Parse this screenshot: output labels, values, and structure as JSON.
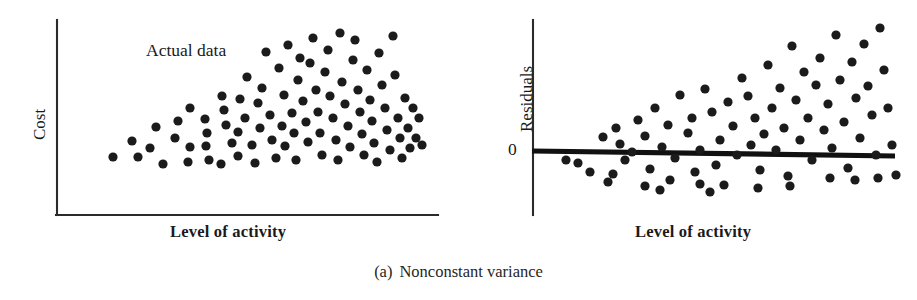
{
  "caption": {
    "index": "(a)",
    "text": "Nonconstant variance"
  },
  "panels": {
    "left": {
      "name": "actual-data-scatter",
      "ylabel": "Cost",
      "xlabel": "Level of activity",
      "annotation": "Actual data"
    },
    "right": {
      "name": "residual-plot",
      "ylabel": "Residuals",
      "xlabel": "Level of activity",
      "zero_tick": "0"
    }
  },
  "colors": {
    "ink": "#1a1a1a",
    "dot": "#1b1b1b",
    "axis": "#2b2b2b",
    "zero_line": "#111111",
    "background": "#ffffff"
  },
  "chart_data": [
    {
      "type": "scatter",
      "id": "actual-data-scatter",
      "title": "",
      "xlabel": "Level of activity",
      "ylabel": "Cost",
      "annotations": [
        "Actual data"
      ],
      "grid": false,
      "legend": null,
      "axes": {
        "origin_px": [
          57,
          215
        ],
        "x_axis_end_px": [
          438,
          215
        ],
        "y_axis_top_px": [
          57,
          20
        ],
        "xlim": [
          0,
          100
        ],
        "ylim": [
          0,
          100
        ],
        "ticks": []
      },
      "dot_radius_px": 4.6,
      "points_px": [
        [
          113,
          157
        ],
        [
          132,
          141
        ],
        [
          138,
          157
        ],
        [
          150,
          148
        ],
        [
          163,
          164
        ],
        [
          156,
          127
        ],
        [
          175,
          138
        ],
        [
          178,
          121
        ],
        [
          190,
          147
        ],
        [
          188,
          162
        ],
        [
          190,
          108
        ],
        [
          205,
          119
        ],
        [
          207,
          133
        ],
        [
          206,
          146
        ],
        [
          209,
          160
        ],
        [
          221,
          164
        ],
        [
          222,
          96
        ],
        [
          224,
          110
        ],
        [
          226,
          125
        ],
        [
          232,
          143
        ],
        [
          238,
          156
        ],
        [
          238,
          132
        ],
        [
          240,
          99
        ],
        [
          245,
          118
        ],
        [
          247,
          77
        ],
        [
          252,
          145
        ],
        [
          255,
          163
        ],
        [
          258,
          103
        ],
        [
          260,
          128
        ],
        [
          262,
          88
        ],
        [
          266,
          52
        ],
        [
          270,
          115
        ],
        [
          272,
          140
        ],
        [
          276,
          158
        ],
        [
          279,
          68
        ],
        [
          282,
          126
        ],
        [
          284,
          95
        ],
        [
          285,
          146
        ],
        [
          288,
          45
        ],
        [
          292,
          113
        ],
        [
          294,
          133
        ],
        [
          296,
          160
        ],
        [
          298,
          80
        ],
        [
          300,
          58
        ],
        [
          303,
          101
        ],
        [
          306,
          122
        ],
        [
          308,
          142
        ],
        [
          310,
          63
        ],
        [
          313,
          38
        ],
        [
          316,
          90
        ],
        [
          318,
          112
        ],
        [
          320,
          133
        ],
        [
          322,
          155
        ],
        [
          325,
          72
        ],
        [
          328,
          50
        ],
        [
          330,
          96
        ],
        [
          333,
          118
        ],
        [
          336,
          140
        ],
        [
          338,
          160
        ],
        [
          340,
          33
        ],
        [
          342,
          82
        ],
        [
          345,
          104
        ],
        [
          348,
          126
        ],
        [
          350,
          147
        ],
        [
          353,
          60
        ],
        [
          355,
          40
        ],
        [
          358,
          90
        ],
        [
          360,
          112
        ],
        [
          362,
          134
        ],
        [
          364,
          155
        ],
        [
          367,
          70
        ],
        [
          370,
          100
        ],
        [
          372,
          121
        ],
        [
          374,
          143
        ],
        [
          377,
          162
        ],
        [
          379,
          53
        ],
        [
          382,
          85
        ],
        [
          385,
          108
        ],
        [
          387,
          130
        ],
        [
          390,
          150
        ],
        [
          393,
          36
        ],
        [
          395,
          75
        ],
        [
          398,
          118
        ],
        [
          400,
          138
        ],
        [
          402,
          158
        ],
        [
          405,
          98
        ],
        [
          408,
          128
        ],
        [
          410,
          148
        ],
        [
          413,
          108
        ],
        [
          416,
          138
        ],
        [
          419,
          118
        ],
        [
          422,
          145
        ]
      ]
    },
    {
      "type": "scatter",
      "id": "residual-plot",
      "title": "",
      "xlabel": "Level of activity",
      "ylabel": "Residuals",
      "annotations": [],
      "grid": false,
      "legend": null,
      "axes": {
        "origin_px": [
          533,
          152
        ],
        "y_axis_top_px": [
          533,
          20
        ],
        "y_axis_bottom_px": [
          533,
          215
        ],
        "zero_line_px": [
          [
            533,
            151
          ],
          [
            895,
            156
          ]
        ],
        "xlim": [
          0,
          100
        ],
        "ylim": [
          -25,
          75
        ],
        "ticks": [
          {
            "axis": "y",
            "value": 0,
            "label": "0"
          }
        ]
      },
      "dot_radius_px": 4.6,
      "reference_line": {
        "label": "0",
        "slope": "near-zero",
        "description": "thick horizontal residual-zero line"
      },
      "dot_radius_note": "residuals fan outward as level of activity increases",
      "points_px": [
        [
          603,
          137
        ],
        [
          578,
          163
        ],
        [
          616,
          128
        ],
        [
          620,
          144
        ],
        [
          625,
          160
        ],
        [
          613,
          174
        ],
        [
          632,
          152
        ],
        [
          638,
          120
        ],
        [
          645,
          136
        ],
        [
          650,
          169
        ],
        [
          655,
          108
        ],
        [
          662,
          147
        ],
        [
          668,
          125
        ],
        [
          670,
          180
        ],
        [
          675,
          158
        ],
        [
          680,
          95
        ],
        [
          688,
          133
        ],
        [
          692,
          118
        ],
        [
          695,
          172
        ],
        [
          700,
          150
        ],
        [
          705,
          89
        ],
        [
          712,
          112
        ],
        [
          716,
          165
        ],
        [
          720,
          140
        ],
        [
          724,
          185
        ],
        [
          728,
          102
        ],
        [
          733,
          126
        ],
        [
          737,
          155
        ],
        [
          742,
          78
        ],
        [
          748,
          96
        ],
        [
          751,
          145
        ],
        [
          755,
          118
        ],
        [
          760,
          170
        ],
        [
          764,
          134
        ],
        [
          768,
          65
        ],
        [
          772,
          108
        ],
        [
          776,
          150
        ],
        [
          780,
          88
        ],
        [
          784,
          128
        ],
        [
          788,
          176
        ],
        [
          792,
          46
        ],
        [
          796,
          100
        ],
        [
          800,
          140
        ],
        [
          804,
          72
        ],
        [
          808,
          118
        ],
        [
          812,
          160
        ],
        [
          816,
          85
        ],
        [
          820,
          58
        ],
        [
          824,
          130
        ],
        [
          828,
          104
        ],
        [
          832,
          148
        ],
        [
          836,
          35
        ],
        [
          840,
          80
        ],
        [
          844,
          122
        ],
        [
          848,
          168
        ],
        [
          852,
          62
        ],
        [
          856,
          98
        ],
        [
          860,
          138
        ],
        [
          864,
          44
        ],
        [
          868,
          86
        ],
        [
          872,
          115
        ],
        [
          876,
          155
        ],
        [
          880,
          28
        ],
        [
          884,
          70
        ],
        [
          888,
          108
        ],
        [
          892,
          145
        ],
        [
          896,
          175
        ],
        [
          566,
          160
        ],
        [
          590,
          172
        ],
        [
          660,
          190
        ],
        [
          710,
          192
        ],
        [
          790,
          186
        ],
        [
          855,
          180
        ],
        [
          878,
          178
        ],
        [
          830,
          178
        ],
        [
          758,
          188
        ],
        [
          700,
          184
        ],
        [
          645,
          186
        ],
        [
          608,
          182
        ]
      ]
    }
  ]
}
